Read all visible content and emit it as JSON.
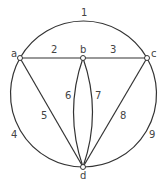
{
  "diagram": {
    "type": "graph",
    "nodes": [
      {
        "id": "a",
        "label": "a",
        "x": 20,
        "y": 58
      },
      {
        "id": "b",
        "label": "b",
        "x": 83,
        "y": 58
      },
      {
        "id": "c",
        "label": "c",
        "x": 147,
        "y": 58
      },
      {
        "id": "d",
        "label": "d",
        "x": 83,
        "y": 167
      }
    ],
    "edges": [
      {
        "label": "1",
        "from": "a",
        "to": "c",
        "shape": "outer-arc-top"
      },
      {
        "label": "2",
        "from": "a",
        "to": "b",
        "shape": "straight"
      },
      {
        "label": "3",
        "from": "b",
        "to": "c",
        "shape": "straight"
      },
      {
        "label": "4",
        "from": "a",
        "to": "d",
        "shape": "outer-arc-left"
      },
      {
        "label": "5",
        "from": "a",
        "to": "d",
        "shape": "straight"
      },
      {
        "label": "6",
        "from": "b",
        "to": "d",
        "shape": "curve-left"
      },
      {
        "label": "7",
        "from": "b",
        "to": "d",
        "shape": "curve-right"
      },
      {
        "label": "8",
        "from": "c",
        "to": "d",
        "shape": "straight"
      },
      {
        "label": "9",
        "from": "c",
        "to": "d",
        "shape": "outer-arc-right"
      }
    ]
  }
}
